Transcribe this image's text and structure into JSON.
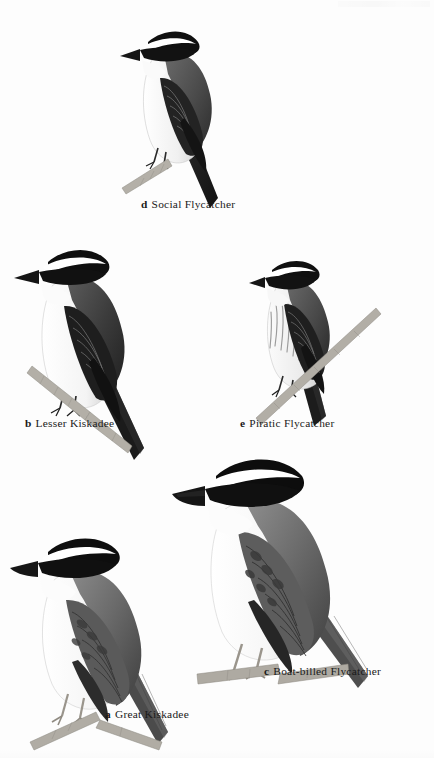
{
  "plate": {
    "kind": "field-guide-illustration-plate",
    "background_color": "#fdfdfd",
    "ink_color": "#1a1a1a",
    "style": "grayscale scientific bird illustration",
    "figure_count": 5
  },
  "figures": [
    {
      "index": "d",
      "name": "Social Flycatcher",
      "label_text": "Social Flycatcher",
      "position": {
        "left": 120,
        "top": 18
      },
      "perch": true,
      "breast": "plain pale",
      "bill": "short"
    },
    {
      "index": "b",
      "name": "Lesser Kiskadee",
      "label_text": "Lesser Kiskadee",
      "position": {
        "left": 18,
        "top": 238
      },
      "perch": true,
      "breast": "plain white",
      "bill": "long slender"
    },
    {
      "index": "e",
      "name": "Piratic Flycatcher",
      "label_text": "Piratic Flycatcher",
      "position": {
        "left": 252,
        "top": 252
      },
      "perch": true,
      "breast": "streaked",
      "bill": "short stubby"
    },
    {
      "index": "a",
      "name": "Great Kiskadee",
      "label_text": "Great Kiskadee",
      "position": {
        "left": 14,
        "top": 528
      },
      "perch": true,
      "breast": "plain white",
      "bill": "heavy"
    },
    {
      "index": "c",
      "name": "Boat-billed Flycatcher",
      "label_text": "Boat-billed Flycatcher",
      "position": {
        "left": 176,
        "top": 450
      },
      "perch": true,
      "breast": "plain white",
      "bill": "very heavy broad"
    }
  ],
  "labels": [
    {
      "index": "d",
      "text": "Social Flycatcher",
      "left": 141,
      "top": 199
    },
    {
      "index": "b",
      "text": "Lesser Kiskadee",
      "left": 25,
      "top": 418
    },
    {
      "index": "e",
      "text": "Piratic Flycatcher",
      "left": 240,
      "top": 418
    },
    {
      "index": "a",
      "text": "Great Kiskadee",
      "left": 105,
      "top": 709
    },
    {
      "index": "c",
      "text": "Boat-billed Flycatcher",
      "left": 264,
      "top": 666
    }
  ],
  "palette": {
    "black": "#141414",
    "dark_gray": "#3a3a3a",
    "mid_gray": "#6e6e6e",
    "light_gray": "#b5b5b5",
    "pale": "#ececec",
    "white": "#ffffff",
    "branch": "#a8a49c"
  }
}
